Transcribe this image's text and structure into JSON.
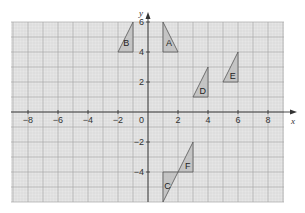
{
  "diagram": {
    "type": "coordinate-grid",
    "axes": {
      "x_label": "x",
      "y_label": "y",
      "x_ticks": [
        {
          "value": -8,
          "label": "−8"
        },
        {
          "value": -6,
          "label": "−6"
        },
        {
          "value": -4,
          "label": "−4"
        },
        {
          "value": -2,
          "label": "−2"
        },
        {
          "value": 2,
          "label": "2"
        },
        {
          "value": 4,
          "label": "4"
        },
        {
          "value": 6,
          "label": "6"
        },
        {
          "value": 8,
          "label": "8"
        }
      ],
      "y_ticks": [
        {
          "value": 6,
          "label": "6"
        },
        {
          "value": 4,
          "label": "4"
        },
        {
          "value": 2,
          "label": "2"
        },
        {
          "value": -2,
          "label": "−2"
        },
        {
          "value": -4,
          "label": "−4"
        }
      ],
      "origin_label": "0",
      "x_range": [
        -9,
        9
      ],
      "y_range": [
        -6,
        6
      ]
    },
    "triangles": [
      {
        "name": "A",
        "points": [
          [
            1,
            6
          ],
          [
            1,
            4
          ],
          [
            2,
            4
          ]
        ],
        "label_pos": [
          1.4,
          4.6
        ]
      },
      {
        "name": "B",
        "points": [
          [
            -1,
            6
          ],
          [
            -1,
            4
          ],
          [
            -2,
            4
          ]
        ],
        "label_pos": [
          -1.45,
          4.6
        ]
      },
      {
        "name": "C",
        "points": [
          [
            1,
            -4
          ],
          [
            1,
            -6
          ],
          [
            2,
            -4
          ]
        ],
        "label_pos": [
          1.3,
          -4.95
        ]
      },
      {
        "name": "D",
        "points": [
          [
            3,
            1
          ],
          [
            4,
            1
          ],
          [
            4,
            3
          ]
        ],
        "label_pos": [
          3.65,
          1.4
        ]
      },
      {
        "name": "E",
        "points": [
          [
            5,
            2
          ],
          [
            6,
            2
          ],
          [
            6,
            4
          ]
        ],
        "label_pos": [
          5.65,
          2.4
        ]
      },
      {
        "name": "F",
        "points": [
          [
            2,
            -4
          ],
          [
            3,
            -4
          ],
          [
            3,
            -2
          ]
        ],
        "label_pos": [
          2.65,
          -3.6
        ]
      }
    ],
    "colors": {
      "grid_bg": "#e6e6e6",
      "grid_major": "#a8a8a8",
      "grid_minor": "#d2d2d2",
      "axis": "#333333",
      "triangle_fill": "#c4c4c4",
      "triangle_stroke": "#555555"
    }
  }
}
